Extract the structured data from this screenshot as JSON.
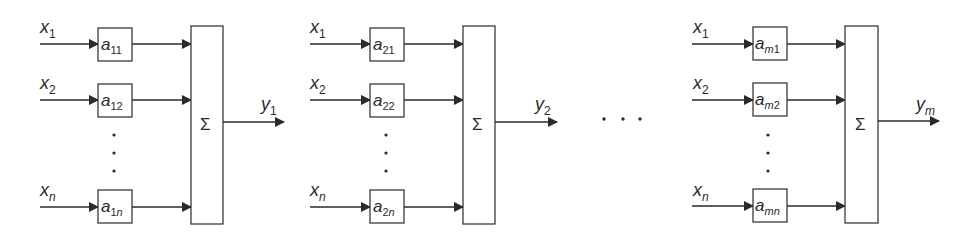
{
  "diagram": {
    "type": "block-diagram",
    "stroke_color": "#2a2a2a",
    "units": [
      {
        "id": "unit-1",
        "inputs": [
          {
            "var": "x",
            "sub": "1",
            "weight_var": "a",
            "weight_sub": "11"
          },
          {
            "var": "x",
            "sub": "2",
            "weight_var": "a",
            "weight_sub": "12"
          },
          {
            "var": "x",
            "sub": "n",
            "weight_var": "a",
            "weight_sub": "1n",
            "weight_sub_parts": [
              "1",
              "n"
            ]
          }
        ],
        "sum_symbol": "Σ",
        "output": {
          "var": "y",
          "sub": "1"
        }
      },
      {
        "id": "unit-2",
        "inputs": [
          {
            "var": "x",
            "sub": "1",
            "weight_var": "a",
            "weight_sub": "21"
          },
          {
            "var": "x",
            "sub": "2",
            "weight_var": "a",
            "weight_sub": "22"
          },
          {
            "var": "x",
            "sub": "n",
            "weight_var": "a",
            "weight_sub": "2n",
            "weight_sub_parts": [
              "2",
              "n"
            ]
          }
        ],
        "sum_symbol": "Σ",
        "output": {
          "var": "y",
          "sub": "2"
        }
      },
      {
        "id": "unit-m",
        "inputs": [
          {
            "var": "x",
            "sub": "1",
            "weight_var": "a",
            "weight_sub": "m1",
            "weight_sub_parts": [
              "m",
              "1"
            ]
          },
          {
            "var": "x",
            "sub": "2",
            "weight_var": "a",
            "weight_sub": "m2",
            "weight_sub_parts": [
              "m",
              "2"
            ]
          },
          {
            "var": "x",
            "sub": "n",
            "weight_var": "a",
            "weight_sub": "mn",
            "weight_sub_parts": [
              "mn",
              ""
            ]
          }
        ],
        "sum_symbol": "Σ",
        "output": {
          "var": "y",
          "sub": "m"
        }
      }
    ],
    "vertical_ellipsis": "⋮",
    "horizontal_ellipsis": "· · ·"
  }
}
